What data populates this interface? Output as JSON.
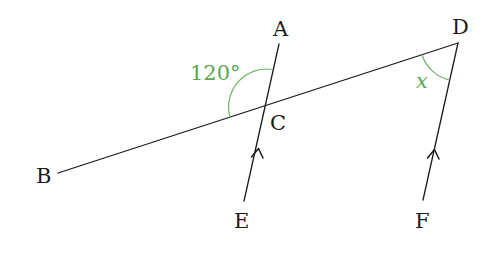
{
  "diagram": {
    "type": "geometry-parallel-lines",
    "points": {
      "A": {
        "label": "A",
        "x": 281,
        "y": 36
      },
      "B": {
        "label": "B",
        "x": 44,
        "y": 182
      },
      "C": {
        "label": "C",
        "x": 279,
        "y": 129
      },
      "D": {
        "label": "D",
        "x": 461,
        "y": 36
      },
      "E": {
        "label": "E",
        "x": 242,
        "y": 228
      },
      "F": {
        "label": "F",
        "x": 423,
        "y": 228
      }
    },
    "segments": [
      {
        "name": "line-BD",
        "from": [
          58,
          173
        ],
        "to": [
          458,
          43
        ]
      },
      {
        "name": "line-AE",
        "from": [
          279,
          44
        ],
        "to": [
          244,
          201
        ]
      },
      {
        "name": "line-DF",
        "from": [
          458,
          43
        ],
        "to": [
          423,
          200
        ]
      }
    ],
    "parallel_marks": [
      {
        "on": "EC",
        "at": [
          257,
          150
        ]
      },
      {
        "on": "DF",
        "at": [
          434,
          152
        ]
      }
    ],
    "angles": [
      {
        "name": "angle-ACB",
        "label": "120°",
        "color": "#5aa84f"
      },
      {
        "name": "angle-BDF",
        "label": "x",
        "color": "#5aa84f"
      }
    ]
  }
}
